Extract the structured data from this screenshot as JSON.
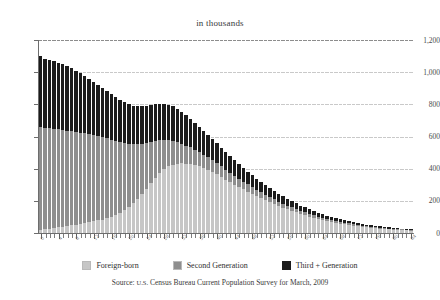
{
  "chart_data": {
    "type": "bar",
    "stacked": true,
    "title": "in thousands",
    "subtitle": "",
    "xlabel": "",
    "ylabel": "",
    "ylim": [
      0,
      1200
    ],
    "yticks": [
      "0",
      "200",
      "400",
      "600",
      "800",
      "1,000",
      "1,200"
    ],
    "ytick_values": [
      0,
      200,
      400,
      600,
      800,
      1000,
      1200
    ],
    "grid": true,
    "legend_position": "bottom",
    "categories": [
      0,
      1,
      2,
      3,
      4,
      5,
      6,
      7,
      8,
      9,
      10,
      11,
      12,
      13,
      14,
      15,
      16,
      17,
      18,
      19,
      20,
      21,
      22,
      23,
      24,
      25,
      26,
      27,
      28,
      29,
      30,
      31,
      32,
      33,
      34,
      35,
      36,
      37,
      38,
      39,
      40,
      41,
      42,
      43,
      44,
      45,
      46,
      47,
      48,
      49,
      50,
      51,
      52,
      53,
      54,
      55,
      56,
      57,
      58,
      59,
      60,
      61,
      62,
      63,
      64,
      65,
      66,
      67,
      68,
      69,
      70,
      71,
      72,
      73,
      74,
      75,
      76,
      77,
      78,
      79,
      80,
      81,
      82,
      83,
      84
    ],
    "xtick_labels": [
      "0",
      "4",
      "8",
      "12",
      "16",
      "20",
      "24",
      "28",
      "32",
      "36",
      "40",
      "44",
      "48",
      "52",
      "56",
      "60",
      "64",
      "68",
      "72",
      "76",
      "80",
      "84"
    ],
    "xtick_step": 4,
    "series": [
      {
        "name": "Foreign-born",
        "color": "#c6c6c6",
        "values": [
          20,
          24,
          28,
          32,
          36,
          40,
          44,
          48,
          52,
          56,
          60,
          66,
          72,
          78,
          84,
          92,
          100,
          112,
          126,
          142,
          160,
          186,
          214,
          244,
          276,
          310,
          344,
          372,
          396,
          414,
          426,
          432,
          434,
          432,
          428,
          422,
          414,
          404,
          392,
          378,
          364,
          348,
          332,
          316,
          300,
          286,
          272,
          258,
          244,
          230,
          216,
          204,
          192,
          180,
          168,
          158,
          148,
          138,
          128,
          118,
          110,
          102,
          94,
          86,
          80,
          74,
          68,
          62,
          58,
          54,
          50,
          46,
          42,
          38,
          35,
          32,
          29,
          26,
          24,
          22,
          20,
          18,
          17,
          16,
          15
        ]
      },
      {
        "name": "Second Generation",
        "color": "#8e8e8e",
        "values": [
          640,
          632,
          624,
          616,
          608,
          600,
          592,
          584,
          576,
          568,
          560,
          548,
          536,
          524,
          512,
          496,
          480,
          462,
          442,
          420,
          396,
          368,
          340,
          312,
          284,
          256,
          230,
          206,
          184,
          164,
          148,
          134,
          122,
          112,
          104,
          96,
          90,
          84,
          78,
          74,
          70,
          66,
          62,
          58,
          54,
          50,
          46,
          44,
          41,
          38,
          36,
          33,
          31,
          29,
          27,
          25,
          23,
          22,
          20,
          19,
          18,
          17,
          16,
          15,
          14,
          13,
          12,
          12,
          11,
          10,
          10,
          9,
          9,
          8,
          8,
          7,
          7,
          7,
          6,
          6,
          6,
          5,
          5,
          5,
          5
        ]
      },
      {
        "name": "Third + Generation",
        "color": "#1c1c1c",
        "values": [
          440,
          428,
          424,
          420,
          414,
          408,
          400,
          392,
          382,
          370,
          356,
          344,
          330,
          318,
          306,
          294,
          282,
          272,
          262,
          252,
          244,
          238,
          234,
          232,
          230,
          228,
          226,
          224,
          222,
          220,
          214,
          206,
          198,
          188,
          178,
          168,
          158,
          148,
          140,
          132,
          124,
          116,
          110,
          104,
          98,
          92,
          86,
          80,
          76,
          70,
          66,
          62,
          58,
          54,
          50,
          46,
          43,
          40,
          37,
          34,
          32,
          29,
          27,
          25,
          23,
          21,
          20,
          18,
          17,
          16,
          14,
          13,
          12,
          11,
          10,
          9,
          9,
          8,
          8,
          7,
          7,
          6,
          6,
          6,
          5
        ]
      }
    ],
    "totals": [
      1100,
      1084,
      1076,
      1068,
      1058,
      1048,
      1036,
      1024,
      1010,
      994,
      976,
      958,
      938,
      920,
      902,
      882,
      862,
      846,
      830,
      814,
      800,
      792,
      788,
      788,
      790,
      794,
      800,
      802,
      802,
      798,
      788,
      772,
      754,
      732,
      710,
      686,
      662,
      636,
      610,
      584,
      558,
      530,
      504,
      478,
      452,
      428,
      404,
      382,
      361,
      338,
      318,
      299,
      281,
      263,
      245,
      229,
      214,
      200,
      185,
      171,
      160,
      148,
      137,
      126,
      117,
      108,
      100,
      92,
      86,
      80,
      74,
      68,
      63,
      57,
      53,
      48,
      45,
      41,
      38,
      35,
      33,
      29,
      28,
      27,
      25
    ]
  },
  "legend": {
    "items": [
      {
        "label": "Foreign-born",
        "swatch": "light-gray-swatch-icon"
      },
      {
        "label": "Second Generation",
        "swatch": "mid-gray-swatch-icon"
      },
      {
        "label": "Third + Generation",
        "swatch": "black-swatch-icon"
      }
    ]
  },
  "source": {
    "prefix": "Source: ",
    "agency": "U.S.",
    "text": " Census Bureau Current Population Survey for March, 2009"
  }
}
